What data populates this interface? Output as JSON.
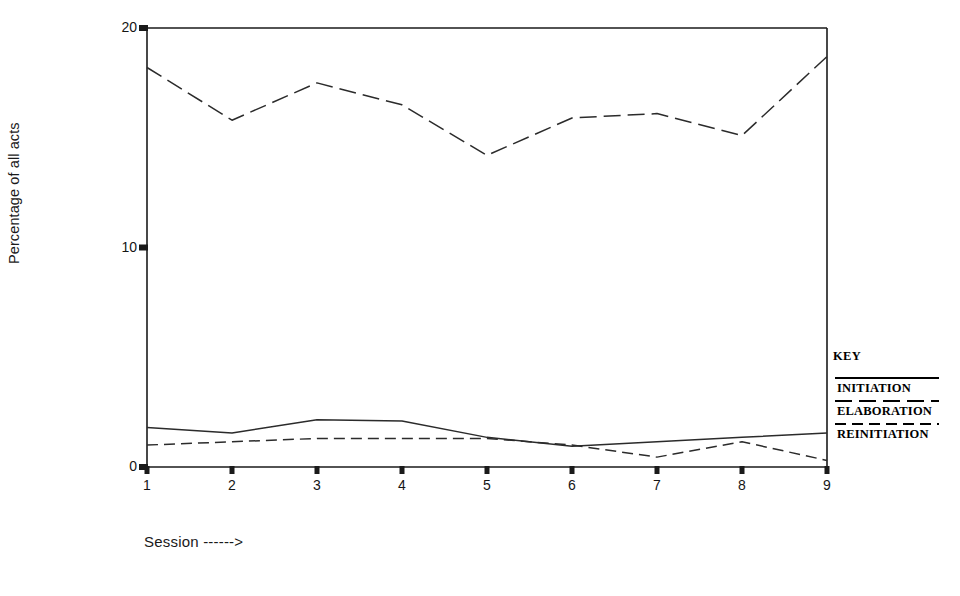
{
  "chart_data": {
    "type": "line",
    "title": "",
    "xlabel": "Session ------>",
    "ylabel": "Percentage of all acts",
    "x": [
      1,
      2,
      3,
      4,
      5,
      6,
      7,
      8,
      9
    ],
    "xtick_labels": [
      "1",
      "2",
      "3",
      "4",
      "5",
      "6",
      "7",
      "8",
      "9"
    ],
    "ytick_labels": [
      "0",
      "10",
      "20"
    ],
    "ytick_values": [
      0,
      10,
      20
    ],
    "xlim": [
      1,
      9
    ],
    "ylim": [
      0,
      20
    ],
    "grid": false,
    "legend_position": "right-outside",
    "legend_title": "KEY",
    "series": [
      {
        "name": "INITIATION",
        "style": "solid",
        "values": [
          1.8,
          1.55,
          2.15,
          2.1,
          1.35,
          0.95,
          1.15,
          1.35,
          1.55
        ]
      },
      {
        "name": "ELABORATION",
        "style": "long-dash",
        "values": [
          18.2,
          15.8,
          17.5,
          16.5,
          14.2,
          15.9,
          16.1,
          15.1,
          18.7
        ]
      },
      {
        "name": "REINITIATION",
        "style": "medium-dash",
        "values": [
          1.0,
          1.15,
          1.3,
          1.3,
          1.3,
          1.0,
          0.45,
          1.15,
          0.3
        ]
      }
    ]
  },
  "legend": {
    "title": "KEY",
    "entries": [
      {
        "label": "INITIATION",
        "style": "solid"
      },
      {
        "label": "ELABORATION",
        "style": "long-dash"
      },
      {
        "label": "REINITIATION",
        "style": "medium-dash"
      }
    ]
  },
  "axes": {
    "y_title": "Percentage of all acts",
    "x_title": "Session ------>",
    "y_ticks": [
      "0",
      "10",
      "20"
    ],
    "x_ticks": [
      "1",
      "2",
      "3",
      "4",
      "5",
      "6",
      "7",
      "8",
      "9"
    ]
  },
  "colors": {
    "line": "#2b2b2b",
    "axis": "#1a1a1a",
    "text": "#151515",
    "background": "#ffffff"
  }
}
